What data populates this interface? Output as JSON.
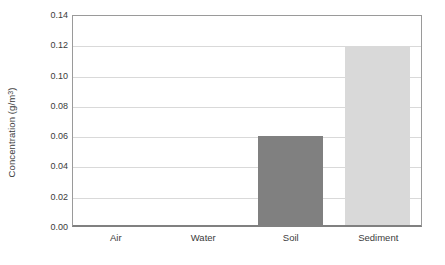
{
  "chart_data": {
    "type": "bar",
    "title": "",
    "xlabel": "",
    "ylabel": "Concentration (g/m³)",
    "ylabel_base": "Concentration (g/m",
    "ylabel_superscript": "3",
    "ylabel_tail": ")",
    "categories": [
      "Air",
      "Water",
      "Soil",
      "Sediment"
    ],
    "values": [
      0.0,
      0.0,
      0.059,
      0.118
    ],
    "bar_colors": [
      "#808080",
      "#808080",
      "#808080",
      "#d9d9d9"
    ],
    "ylim": [
      0.0,
      0.14
    ],
    "ytick_values": [
      0.0,
      0.02,
      0.04,
      0.06,
      0.08,
      0.1,
      0.12,
      0.14
    ],
    "ytick_labels": [
      "0.00",
      "0.02",
      "0.04",
      "0.06",
      "0.08",
      "0.10",
      "0.12",
      "0.14"
    ],
    "grid": true,
    "grid_axis": "y",
    "legend": false,
    "legend_position": "none",
    "plot_background": "#ffffff",
    "grid_color": "#d9d9d9",
    "axis_color": "#808080",
    "text_color": "#3b3b3b"
  }
}
